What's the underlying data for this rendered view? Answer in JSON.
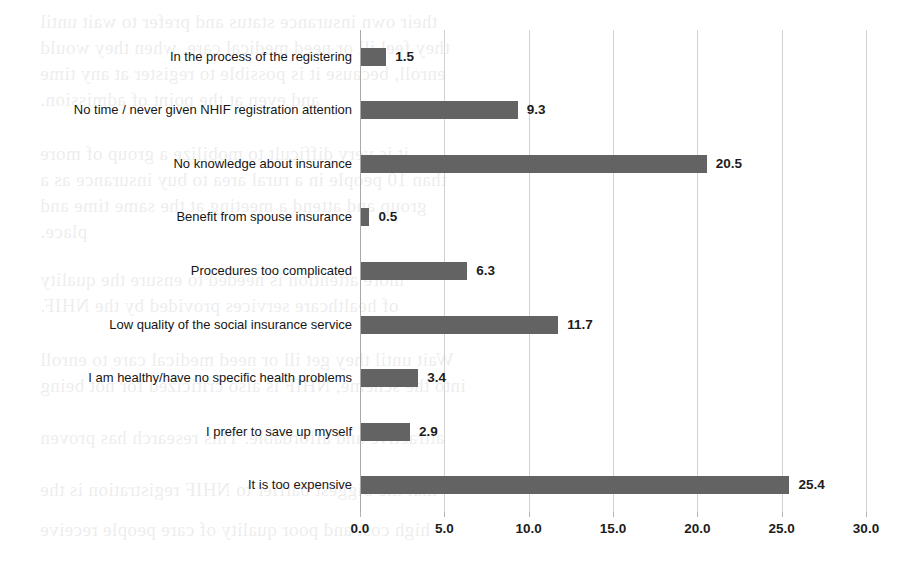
{
  "chart_data": {
    "type": "bar",
    "orientation": "horizontal",
    "title": "",
    "subtitle": "",
    "xlabel": "",
    "ylabel": "",
    "xlim": [
      0.0,
      30.0
    ],
    "xticks": [
      "0.0",
      "5.0",
      "10.0",
      "15.0",
      "20.0",
      "25.0",
      "30.0"
    ],
    "xtick_step": 5.0,
    "grid": true,
    "legend": false,
    "legend_position": "none",
    "bar_color": "#636363",
    "gridline_color": "#d2d2d2",
    "axis_color": "#a9a9a9",
    "value_labels": true,
    "categories": [
      "In the process of the registering",
      "No time / never given NHIF registration attention",
      "No knowledge about insurance",
      "Benefit from spouse insurance",
      "Procedures too complicated",
      "Low quality of the social insurance service",
      "I am healthy/have no specific health problems",
      "I prefer to save up myself",
      "It is too expensive"
    ],
    "values": [
      1.5,
      9.3,
      20.5,
      0.5,
      6.3,
      11.7,
      3.4,
      2.9,
      25.4
    ],
    "value_labels_text": [
      "1.5",
      "9.3",
      "20.5",
      "0.5",
      "6.3",
      "11.7",
      "3.4",
      "2.9",
      "25.4"
    ]
  },
  "background_text": {
    "lines": [
      "their own insurance status and prefer to wait until",
      "they feel ill or need medical care, when they would",
      "enroll, because it is possible to register at any time",
      "and even at the point of admission.",
      "it is very difficult to mobilize a group of more",
      "than 10 people in a rural area to buy insurance as a",
      "group and attend a  meeting at the same time and",
      "place.",
      "more attention is needed to ensure the quality",
      "of healthcare services provided by the NHIF.",
      "Wait until they get ill or need medical care to enroll",
      "into the scheme, NHIF is also criticized for not being",
      "attractive and affordable. This research has proven",
      "that the biggest barrier to NHIF registration is the",
      "high cost and poor quality of care people receive"
    ]
  }
}
